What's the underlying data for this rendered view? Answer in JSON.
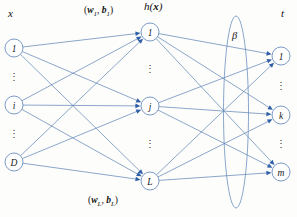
{
  "diagram": {
    "title_labels": {
      "input_label": "x",
      "hidden_label_h": "h",
      "hidden_label_paren_open": "(",
      "hidden_label_x": "x",
      "hidden_label_paren_close": ")",
      "output_label": "t"
    },
    "weight_labels": {
      "first": {
        "open": "(",
        "w": "w",
        "w_sub": "1",
        "comma": ", ",
        "b": "b",
        "b_sub": "1",
        "close": ")"
      },
      "last": {
        "open": "(",
        "w": "w",
        "w_sub": "L",
        "comma": ", ",
        "b": "b",
        "b_sub": "L",
        "close": ")"
      }
    },
    "beta": {
      "symbol": "β"
    },
    "ellipsis": "⋮",
    "colors": {
      "edge": "#5a7fb5",
      "arrow": "#2f5fa8",
      "node_stroke": "#6b8fc0",
      "background": "#fdfdfb",
      "text": "#111111"
    },
    "layers": [
      {
        "name": "input",
        "x": 14,
        "nodes": [
          {
            "label": "1",
            "y": 48
          },
          {
            "label": "i",
            "y": 105
          },
          {
            "label": "D",
            "y": 162
          }
        ],
        "ellipses": [
          {
            "y": 78
          },
          {
            "y": 135
          }
        ]
      },
      {
        "name": "hidden",
        "x": 150,
        "nodes": [
          {
            "label": "1",
            "y": 32
          },
          {
            "label": "j",
            "y": 106
          },
          {
            "label": "L",
            "y": 181
          }
        ],
        "ellipses": [
          {
            "y": 70
          },
          {
            "y": 145
          }
        ]
      },
      {
        "name": "output",
        "x": 281,
        "nodes": [
          {
            "label": "1",
            "y": 56
          },
          {
            "label": "k",
            "y": 115
          },
          {
            "label": "m",
            "y": 172
          }
        ],
        "ellipses": [
          {
            "y": 87
          },
          {
            "y": 145
          }
        ]
      }
    ],
    "node_radius": 9,
    "beta_ellipse": {
      "cx": 236,
      "cy": 112,
      "rx": 12.5,
      "ry": 96
    }
  }
}
